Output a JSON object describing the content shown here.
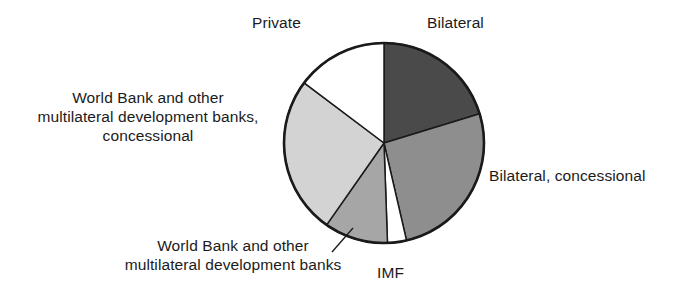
{
  "chart_data": {
    "type": "pie",
    "title": "",
    "subtitle": "",
    "xlabel": "",
    "ylabel": "",
    "legend_position": "none",
    "grid": false,
    "start_angle_deg": 0,
    "direction": "clockwise",
    "center": {
      "x": 384,
      "y": 143
    },
    "radius": 100,
    "categories": [
      "Bilateral",
      "Bilateral, concessional",
      "IMF",
      "World Bank and other multilateral development banks",
      "World Bank and other multilateral development banks, concessional",
      "Private"
    ],
    "values": [
      20.3,
      26.1,
      3.1,
      10.3,
      25.5,
      14.7
    ],
    "slices": [
      {
        "label": "Bilateral",
        "value": 20.3,
        "start_deg": 0,
        "end_deg": 73,
        "color": "#4a4a4a",
        "label_position": "top-right"
      },
      {
        "label": "Bilateral, concessional",
        "value": 26.1,
        "start_deg": 73,
        "end_deg": 167,
        "color": "#8e8e8e",
        "label_position": "right"
      },
      {
        "label": "IMF",
        "value": 3.1,
        "start_deg": 167,
        "end_deg": 178,
        "color": "#ffffff",
        "label_position": "bottom"
      },
      {
        "label": "World Bank and other multilateral development banks",
        "value": 10.3,
        "start_deg": 178,
        "end_deg": 215,
        "color": "#a6a6a6",
        "label_position": "bottom-left"
      },
      {
        "label": "World Bank and other multilateral development banks, concessional",
        "value": 25.5,
        "start_deg": 215,
        "end_deg": 307,
        "color": "#d3d3d3",
        "label_position": "left"
      },
      {
        "label": "Private",
        "value": 14.7,
        "start_deg": 307,
        "end_deg": 360,
        "color": "#ffffff",
        "label_position": "top-left"
      }
    ]
  },
  "labels": {
    "private": "Private",
    "bilateral": "Bilateral",
    "bilateral_concessional": "Bilateral, concessional",
    "imf": "IMF",
    "world_bank_concessional": "World Bank and other\nmultilateral development banks,\nconcessional",
    "world_bank": "World Bank and other\nmultilateral development banks"
  },
  "colors": {
    "outline": "#1a1a1a",
    "background": "#ffffff",
    "text": "#1b1b1b",
    "slice_dark": "#4a4a4a",
    "slice_medium": "#8e8e8e",
    "slice_medium_light": "#a6a6a6",
    "slice_light": "#d3d3d3",
    "slice_white": "#ffffff"
  }
}
